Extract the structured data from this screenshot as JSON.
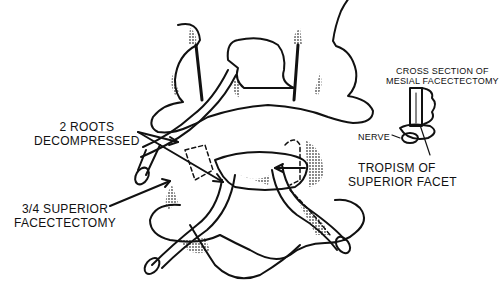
{
  "diagram": {
    "labels": {
      "roots_line1": "2 ROOTS",
      "roots_line2": "DECOMPRESSED",
      "superior_line1": "3/4 SUPERIOR",
      "superior_line2": "FACECTECTOMY",
      "tropism_line1": "TROPISM OF",
      "tropism_line2": "SUPERIOR FACET",
      "cross_line1": "CROSS SECTION OF",
      "cross_line2": "MESIAL FACECTECTOMY",
      "nerve": "NERVE"
    },
    "colors": {
      "ink": "#111111",
      "shade": "#888888",
      "background": "#ffffff"
    }
  }
}
